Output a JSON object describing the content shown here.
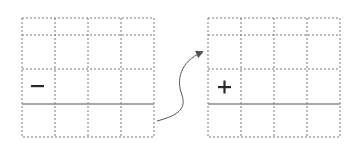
{
  "diagram": {
    "left_grid": {
      "sign": "minus",
      "symbol": "−",
      "columns": 4,
      "rows": 4
    },
    "right_grid": {
      "sign": "plus",
      "symbol": "+",
      "columns": 4,
      "rows": 4
    },
    "arrow": {
      "from": "left-grid",
      "to": "right-grid",
      "style": "curved"
    },
    "colors": {
      "grid_line": "#7a7a7a",
      "solid_line": "#8a8a8a",
      "sign": "#2a2a2a",
      "arrow": "#555555"
    }
  }
}
